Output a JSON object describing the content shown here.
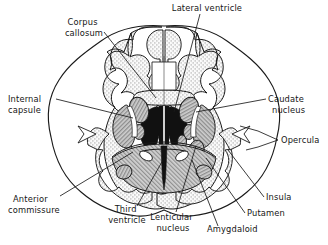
{
  "figure": {
    "kind": "anatomical-diagram",
    "background_color": "#ffffff",
    "ink_color": "#161616"
  },
  "palette": {
    "outline": "#1a1a1a",
    "cortex_stipple": "#d9d9d9",
    "white_matter": "#ffffff",
    "ventricle_black": "#111111",
    "nucleus_mid_gray": "#9a9a9a",
    "hatched_gray": "#b0b0b0",
    "leader_line": "#1a1a1a"
  },
  "labels": [
    {
      "id": "lateral-ventricle",
      "text": "Lateral ventricle",
      "lines": [
        "Lateral ventricle"
      ],
      "anchor": "middle",
      "x": 207,
      "y": 11
    },
    {
      "id": "corpus-callosum",
      "text": "Corpus callosum",
      "lines": [
        "Corpus",
        "callosum"
      ],
      "anchor": "middle",
      "x": 84,
      "y": 25
    },
    {
      "id": "internal-capsule",
      "text": "Internal capsule",
      "lines": [
        "Internal",
        "capsule"
      ],
      "anchor": "start",
      "x": 8,
      "y": 102
    },
    {
      "id": "caudate-nucleus",
      "text": "Caudate nucleus",
      "lines": [
        "Caudate",
        "nucleus"
      ],
      "anchor": "start",
      "x": 268,
      "y": 102
    },
    {
      "id": "opercula",
      "text": "Opercula",
      "lines": [
        "Opercula"
      ],
      "anchor": "start",
      "x": 280,
      "y": 143
    },
    {
      "id": "insula",
      "text": "Insula",
      "lines": [
        "Insula"
      ],
      "anchor": "start",
      "x": 266,
      "y": 200
    },
    {
      "id": "putamen",
      "text": "Putamen",
      "lines": [
        "Putamen"
      ],
      "anchor": "start",
      "x": 247,
      "y": 216
    },
    {
      "id": "amygdaloid",
      "text": "Amygdaloid",
      "lines": [
        "Amygdaloid"
      ],
      "anchor": "start",
      "x": 207,
      "y": 232
    },
    {
      "id": "lenticular-nucleus",
      "text": "Lenticular nucleus",
      "lines": [
        "Lenticular",
        "nucleus"
      ],
      "anchor": "middle",
      "x": 173,
      "y": 220
    },
    {
      "id": "third-ventricle",
      "text": "Third ventricle",
      "lines": [
        "Third",
        "ventricle"
      ],
      "anchor": "middle",
      "x": 127,
      "y": 212
    },
    {
      "id": "anterior-commissure",
      "text": "Anterior commissure",
      "lines": [
        "Anterior",
        "commissure"
      ],
      "anchor": "start",
      "x": 13,
      "y": 202
    }
  ],
  "structures": [
    {
      "id": "cerebral-cortex",
      "name": "Cerebral cortex (stippled gray matter ribbon)"
    },
    {
      "id": "white-matter",
      "name": "Cerebral white matter (unshaded core)"
    },
    {
      "id": "lateral-ventricles",
      "name": "Lateral ventricles (solid black, wing-shaped)"
    },
    {
      "id": "third-ventricle",
      "name": "Third ventricle (narrow black midline slit)"
    },
    {
      "id": "caudate-nucleus",
      "name": "Caudate nucleus (gray ovals flanking lateral ventricles)"
    },
    {
      "id": "internal-capsule",
      "name": "Internal capsule (pale band between caudate and lenticular nucleus)"
    },
    {
      "id": "lenticular-nucleus",
      "name": "Lenticular nucleus (putamen + globus pallidus, gray mass)"
    },
    {
      "id": "putamen",
      "name": "Putamen (lateral part of lenticular nucleus)"
    },
    {
      "id": "insula",
      "name": "Insula (buried cortex at depth of lateral fissure)"
    },
    {
      "id": "opercula",
      "name": "Opercula (frontal, parietal, temporal lips over insula)"
    },
    {
      "id": "amygdaloid",
      "name": "Amygdaloid body (gray nucleus in temporal lobe)"
    },
    {
      "id": "anterior-commissure",
      "name": "Anterior commissure (crossing fibre bundle)"
    },
    {
      "id": "corpus-callosum",
      "name": "Corpus callosum (midline commissural plate)"
    },
    {
      "id": "hypothalamus-region",
      "name": "Hatched diencephalic region beneath ventricles"
    }
  ]
}
